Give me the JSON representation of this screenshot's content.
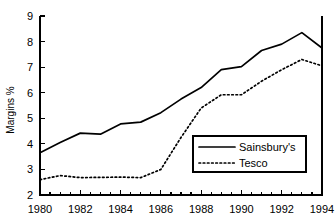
{
  "chart_data": {
    "type": "line",
    "title": "",
    "xlabel": "",
    "ylabel": "Margins %",
    "xlim": [
      1980,
      1994
    ],
    "ylim": [
      2,
      9
    ],
    "grid": false,
    "legend_position": "center-right",
    "x": [
      1980,
      1981,
      1982,
      1983,
      1984,
      1985,
      1986,
      1987,
      1988,
      1989,
      1990,
      1991,
      1992,
      1993,
      1994
    ],
    "xticklabels": [
      "1980",
      "1982",
      "1984",
      "1986",
      "1988",
      "1990",
      "1992",
      "1994"
    ],
    "xtickvalues": [
      1980,
      1982,
      1984,
      1986,
      1988,
      1990,
      1992,
      1994
    ],
    "yticklabels": [
      "2",
      "3",
      "4",
      "5",
      "6",
      "7",
      "8",
      "9"
    ],
    "ytickvalues": [
      2,
      3,
      4,
      5,
      6,
      7,
      8,
      9
    ],
    "minor_xticks_per_interval": 2,
    "series": [
      {
        "name": "Sainsbury's",
        "style": "solid",
        "color": "#000000",
        "values": [
          3.65,
          4.05,
          4.42,
          4.38,
          4.78,
          4.85,
          5.22,
          5.75,
          6.2,
          6.9,
          7.02,
          7.65,
          7.9,
          8.35,
          7.75
        ]
      },
      {
        "name": "Tesco",
        "style": "dotted",
        "color": "#000000",
        "values": [
          2.6,
          2.76,
          2.68,
          2.69,
          2.7,
          2.68,
          3.0,
          4.25,
          5.4,
          5.92,
          5.92,
          6.45,
          6.9,
          7.3,
          7.05
        ]
      }
    ]
  },
  "legend": {
    "entries": [
      {
        "label": "Sainsbury's",
        "style": "solid"
      },
      {
        "label": "Tesco",
        "style": "dotted"
      }
    ]
  },
  "axes": {
    "y_title": "Margins %"
  }
}
